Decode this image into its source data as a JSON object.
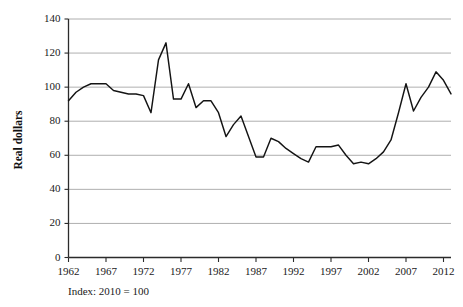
{
  "chart_data": {
    "type": "line",
    "title": "",
    "subtitle": "",
    "xlabel": "",
    "ylabel": "Real dollars",
    "footnote": "Index: 2010 = 100",
    "grid": "horizontal",
    "legend": "none",
    "xlim": [
      1962,
      2013
    ],
    "ylim": [
      0,
      140
    ],
    "ytick_step": 20,
    "xtick_step": 5,
    "yticks": [
      0,
      20,
      40,
      60,
      80,
      100,
      120,
      140
    ],
    "xticks": [
      1962,
      1967,
      1972,
      1977,
      1982,
      1987,
      1992,
      1997,
      2002,
      2007,
      2012
    ],
    "line_color": "#141414",
    "grid_color": "#9a9a9a",
    "axis_color": "#2b2b2b",
    "series": [
      {
        "name": "Real dollars index",
        "x": [
          1962,
          1963,
          1964,
          1965,
          1966,
          1967,
          1968,
          1969,
          1970,
          1971,
          1972,
          1973,
          1974,
          1975,
          1976,
          1977,
          1978,
          1979,
          1980,
          1981,
          1982,
          1983,
          1984,
          1985,
          1986,
          1987,
          1988,
          1989,
          1990,
          1991,
          1992,
          1993,
          1994,
          1995,
          1996,
          1997,
          1998,
          1999,
          2000,
          2001,
          2002,
          2003,
          2004,
          2005,
          2006,
          2007,
          2008,
          2009,
          2010,
          2011,
          2012,
          2013
        ],
        "values": [
          92,
          97,
          100,
          102,
          102,
          102,
          98,
          97,
          96,
          96,
          95,
          85,
          116,
          126,
          93,
          93,
          102,
          88,
          92,
          92,
          85,
          71,
          78,
          83,
          71,
          59,
          59,
          70,
          68,
          64,
          61,
          58,
          56,
          65,
          65,
          65,
          66,
          60,
          55,
          56,
          55,
          58,
          62,
          69,
          85,
          102,
          86,
          94,
          100,
          109,
          104,
          96
        ]
      }
    ]
  },
  "axes": {
    "y_label": "Real dollars",
    "y_tick_labels": [
      "0",
      "20",
      "40",
      "60",
      "80",
      "100",
      "120",
      "140"
    ],
    "x_tick_labels": [
      "1962",
      "1967",
      "1972",
      "1977",
      "1982",
      "1987",
      "1992",
      "1997",
      "2002",
      "2007",
      "2012"
    ]
  },
  "caption": {
    "index_note": "Index: 2010 = 100"
  }
}
